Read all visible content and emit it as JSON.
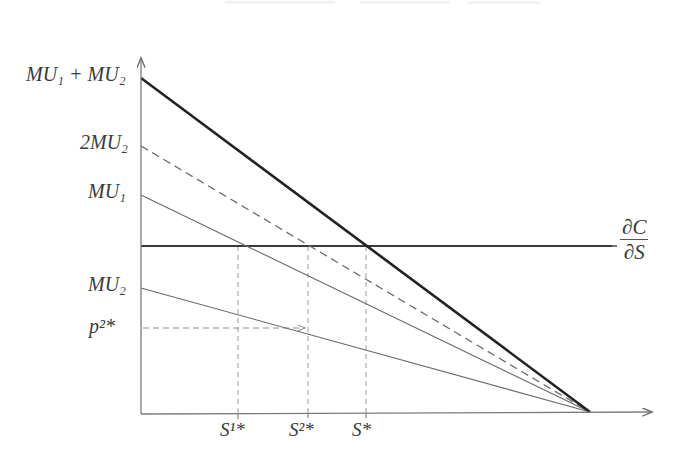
{
  "figure": {
    "kind": "economics-line-diagram",
    "background_color": "#ffffff",
    "axes": {
      "y_label": "p",
      "x_label": "S",
      "origin": [
        141,
        414
      ],
      "y_axis_top": 55,
      "x_axis_right": 655,
      "axis_color": "#7a7a7a"
    },
    "labels": {
      "mu1_plus_mu2": "MU₁ + MU₂",
      "two_mu2": "2MU₂",
      "mu1": "MU₁",
      "mu2": "MU₂",
      "p2_star": "p²*",
      "s1_star": "S¹*",
      "s2_star": "S²*",
      "s_star": "S*",
      "dc_ds_numerator": "∂C",
      "dc_ds_denominator": "∂S"
    },
    "curves": [
      {
        "name": "mu1-plus-mu2-curve",
        "label": "MU₁ + MU₂",
        "style": "solid-thick",
        "color": "#222222",
        "width": 2.6,
        "y_intercept": 78,
        "x_intercept": 590
      },
      {
        "name": "two-mu2-curve",
        "label": "2MU₂",
        "style": "dashed",
        "color": "#6e6e6e",
        "width": 1.3,
        "y_intercept": 146,
        "x_intercept": 590
      },
      {
        "name": "mu1-curve",
        "label": "MU₁",
        "style": "solid-thin",
        "color": "#6a6a6a",
        "width": 1.1,
        "y_intercept": 195,
        "x_intercept": 590
      },
      {
        "name": "mu2-curve",
        "label": "MU₂",
        "style": "solid-thin",
        "color": "#6a6a6a",
        "width": 1.1,
        "y_intercept": 288,
        "x_intercept": 590
      }
    ],
    "marginal_cost_line": {
      "name": "marginal-cost-line",
      "label": "∂C/∂S",
      "style": "solid",
      "color": "#3a3a3a",
      "width": 1.8,
      "y_level": 246,
      "x_start": 141,
      "x_end": 612
    },
    "guides": [
      {
        "name": "guide-s1-star",
        "orientation": "vertical",
        "x": 238,
        "y_from": 246,
        "y_to": 414
      },
      {
        "name": "guide-s2-star",
        "orientation": "vertical",
        "x": 308,
        "y_from": 246,
        "y_to": 414
      },
      {
        "name": "guide-s-star",
        "orientation": "vertical",
        "x": 366,
        "y_from": 246,
        "y_to": 414
      },
      {
        "name": "guide-p2-star",
        "orientation": "horizontal",
        "y": 328,
        "x_from": 141,
        "x_to": 308
      }
    ],
    "ticks": [
      {
        "name": "tick-s1-star",
        "x": 238
      },
      {
        "name": "tick-s2-star",
        "x": 308
      },
      {
        "name": "tick-s-star",
        "x": 366
      }
    ],
    "intersections": [
      {
        "name": "intersection-mu1-mc",
        "x": 238,
        "y": 246
      },
      {
        "name": "intersection-2mu2-mc",
        "x": 308,
        "y": 246
      },
      {
        "name": "intersection-total-mc",
        "x": 366,
        "y": 246
      },
      {
        "name": "intersection-mu2-p2",
        "x": 308,
        "y": 328
      }
    ],
    "convergence_point": {
      "name": "convergence-point",
      "x": 590,
      "y": 412
    }
  }
}
